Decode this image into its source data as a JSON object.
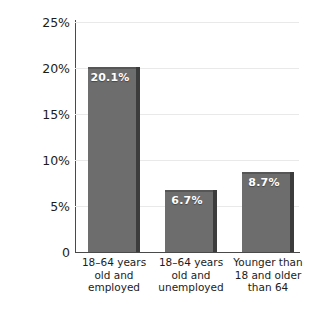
{
  "chart_data": {
    "type": "bar",
    "title": "",
    "xlabel": "",
    "ylabel": "Percentage without insurance",
    "ylim": [
      0,
      25
    ],
    "grid": true,
    "legend": "none",
    "y_tick_labels": [
      "25%",
      "20%",
      "15%",
      "10%",
      "5%",
      "0"
    ],
    "y_tick_values": [
      25,
      20,
      15,
      10,
      5,
      0
    ],
    "categories": [
      "18–64 years old and employed",
      "18–64 years old and unemployed",
      "Younger than 18 and older than 64"
    ],
    "category_lines": [
      [
        "18–64 years",
        "old and",
        "employed"
      ],
      [
        "18–64 years",
        "old and",
        "unemployed"
      ],
      [
        "Younger than",
        "18 and older",
        "than 64"
      ]
    ],
    "values": [
      20.1,
      6.7,
      8.7
    ],
    "value_labels": [
      "20.1%",
      "6.7%",
      "8.7%"
    ],
    "colors": {
      "bar_fill": "#6d6d6d",
      "bar_shadow": "#3c3c3c",
      "axis": "#4a4a4a",
      "gridline": "#e9e9e9",
      "text": "#1c1c1c",
      "value_label": "#ffffff",
      "background": "#ffffff"
    }
  }
}
